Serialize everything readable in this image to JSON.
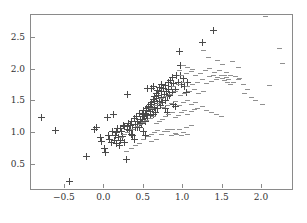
{
  "chart_data": {
    "type": "scatter",
    "title": "",
    "subtitle": "",
    "xlabel": "",
    "ylabel": "",
    "xlim": [
      -0.93,
      2.38
    ],
    "ylim": [
      0.12,
      2.86
    ],
    "xticks": [
      -0.5,
      0.0,
      0.5,
      1.0,
      1.5,
      2.0
    ],
    "xticklabels": [
      "−0.5",
      "0.0",
      "0.5",
      "1.0",
      "1.5",
      "2.0"
    ],
    "yticks": [
      0.5,
      1.0,
      1.5,
      2.0,
      2.5
    ],
    "yticklabels": [
      "0.5",
      "1.0",
      "1.5",
      "2.0",
      "2.5"
    ],
    "grid": false,
    "legend": false,
    "legend_position": "none",
    "frame": true,
    "colors": {
      "cross": "#4a4a4a",
      "dash": "#909090",
      "axis": "#8a8a8a",
      "text": "#333333",
      "background": "#ffffff"
    },
    "series": [
      {
        "name": "cross",
        "marker": "plus",
        "points": [
          [
            -0.8,
            1.245
          ],
          [
            -0.62,
            1.045
          ],
          [
            -0.44,
            0.235
          ],
          [
            -0.23,
            0.625
          ],
          [
            -0.12,
            1.055
          ],
          [
            -0.1,
            1.085
          ],
          [
            -0.05,
            0.935
          ],
          [
            -0.03,
            0.875
          ],
          [
            0.0,
            0.76
          ],
          [
            0.02,
            0.7
          ],
          [
            0.04,
            1.245
          ],
          [
            0.05,
            0.96
          ],
          [
            0.07,
            0.905
          ],
          [
            0.09,
            0.855
          ],
          [
            0.1,
            1.02
          ],
          [
            0.12,
            1.295
          ],
          [
            0.13,
            0.88
          ],
          [
            0.15,
            0.83
          ],
          [
            0.16,
            1.015
          ],
          [
            0.18,
            0.925
          ],
          [
            0.19,
            0.805
          ],
          [
            0.2,
            0.88
          ],
          [
            0.22,
            1.02
          ],
          [
            0.23,
            0.95
          ],
          [
            0.25,
            0.855
          ],
          [
            0.26,
            1.1
          ],
          [
            0.28,
            0.59
          ],
          [
            0.29,
            1.05
          ],
          [
            0.3,
            1.61
          ],
          [
            0.31,
            1.15
          ],
          [
            0.33,
            1.12
          ],
          [
            0.34,
            1.19
          ],
          [
            0.35,
            0.985
          ],
          [
            0.36,
            1.06
          ],
          [
            0.38,
            1.225
          ],
          [
            0.39,
            1.14
          ],
          [
            0.4,
            1.085
          ],
          [
            0.41,
            1.255
          ],
          [
            0.42,
            1.18
          ],
          [
            0.44,
            1.09
          ],
          [
            0.45,
            1.31
          ],
          [
            0.46,
            1.215
          ],
          [
            0.47,
            1.15
          ],
          [
            0.48,
            1.29
          ],
          [
            0.5,
            1.35
          ],
          [
            0.51,
            1.265
          ],
          [
            0.52,
            1.19
          ],
          [
            0.53,
            1.39
          ],
          [
            0.54,
            1.3
          ],
          [
            0.55,
            1.23
          ],
          [
            0.56,
            1.42
          ],
          [
            0.58,
            1.34
          ],
          [
            0.59,
            1.275
          ],
          [
            0.6,
            1.45
          ],
          [
            0.61,
            1.365
          ],
          [
            0.62,
            1.3
          ],
          [
            0.63,
            1.5
          ],
          [
            0.64,
            1.41
          ],
          [
            0.65,
            1.33
          ],
          [
            0.66,
            1.55
          ],
          [
            0.67,
            1.46
          ],
          [
            0.68,
            1.38
          ],
          [
            0.69,
            1.6
          ],
          [
            0.7,
            1.505
          ],
          [
            0.71,
            1.43
          ],
          [
            0.72,
            1.66
          ],
          [
            0.73,
            1.56
          ],
          [
            0.74,
            1.48
          ],
          [
            0.75,
            1.7
          ],
          [
            0.76,
            1.61
          ],
          [
            0.77,
            1.52
          ],
          [
            0.78,
            1.745
          ],
          [
            0.79,
            1.65
          ],
          [
            0.8,
            1.57
          ],
          [
            0.81,
            1.79
          ],
          [
            0.82,
            1.69
          ],
          [
            0.83,
            1.6
          ],
          [
            0.84,
            1.835
          ],
          [
            0.85,
            1.735
          ],
          [
            0.86,
            1.64
          ],
          [
            0.72,
            1.76
          ],
          [
            0.7,
            1.715
          ],
          [
            0.68,
            1.67
          ],
          [
            0.66,
            1.625
          ],
          [
            0.64,
            1.58
          ],
          [
            0.62,
            1.535
          ],
          [
            0.6,
            1.49
          ],
          [
            0.58,
            1.445
          ],
          [
            0.56,
            1.4
          ],
          [
            0.54,
            1.355
          ],
          [
            0.52,
            1.31
          ],
          [
            0.5,
            1.265
          ],
          [
            0.48,
            1.22
          ],
          [
            0.46,
            1.175
          ],
          [
            0.44,
            1.13
          ],
          [
            0.42,
            1.085
          ],
          [
            0.87,
            1.88
          ],
          [
            0.88,
            1.78
          ],
          [
            0.9,
            1.69
          ],
          [
            0.92,
            1.91
          ],
          [
            0.94,
            1.805
          ],
          [
            0.95,
            2.29
          ],
          [
            0.96,
            2.065
          ],
          [
            0.97,
            1.9
          ],
          [
            0.98,
            1.76
          ],
          [
            1.0,
            1.86
          ],
          [
            1.02,
            1.74
          ],
          [
            1.04,
            1.64
          ],
          [
            1.05,
            1.805
          ],
          [
            0.62,
            1.74
          ],
          [
            0.6,
            1.695
          ],
          [
            0.55,
            1.705
          ],
          [
            0.78,
            1.385
          ],
          [
            0.8,
            1.33
          ],
          [
            0.5,
            1.025
          ],
          [
            0.52,
            0.96
          ],
          [
            1.25,
            2.425
          ],
          [
            1.39,
            2.615
          ],
          [
            0.88,
            1.455
          ],
          [
            0.9,
            1.42
          ],
          [
            0.3,
            1.105
          ],
          [
            0.32,
            1.045
          ],
          [
            0.24,
            1.125
          ],
          [
            0.21,
            1.065
          ],
          [
            0.36,
            0.96
          ],
          [
            0.38,
            0.905
          ],
          [
            0.14,
            0.96
          ],
          [
            0.17,
            1.08
          ]
        ]
      },
      {
        "name": "dash",
        "marker": "hline",
        "points": [
          [
            0.28,
            0.715
          ],
          [
            0.34,
            0.76
          ],
          [
            0.4,
            0.8
          ],
          [
            0.45,
            0.835
          ],
          [
            0.5,
            0.905
          ],
          [
            0.56,
            0.94
          ],
          [
            0.6,
            0.975
          ],
          [
            0.64,
            1.01
          ],
          [
            0.68,
            1.045
          ],
          [
            0.72,
            0.985
          ],
          [
            0.76,
            1.02
          ],
          [
            0.8,
            1.055
          ],
          [
            0.85,
            0.965
          ],
          [
            0.9,
            1.0
          ],
          [
            0.95,
            1.055
          ],
          [
            1.0,
            1.01
          ],
          [
            1.05,
            0.98
          ],
          [
            0.42,
            1.1
          ],
          [
            0.46,
            1.135
          ],
          [
            0.5,
            1.165
          ],
          [
            0.54,
            1.2
          ],
          [
            0.58,
            1.23
          ],
          [
            0.62,
            1.265
          ],
          [
            0.66,
            1.15
          ],
          [
            0.7,
            1.185
          ],
          [
            0.74,
            1.22
          ],
          [
            0.78,
            1.255
          ],
          [
            0.82,
            1.29
          ],
          [
            0.86,
            1.325
          ],
          [
            0.9,
            1.25
          ],
          [
            0.94,
            1.285
          ],
          [
            0.98,
            1.32
          ],
          [
            1.02,
            1.355
          ],
          [
            1.06,
            1.3
          ],
          [
            1.1,
            1.335
          ],
          [
            1.14,
            1.37
          ],
          [
            0.6,
            1.395
          ],
          [
            0.65,
            1.43
          ],
          [
            0.7,
            1.465
          ],
          [
            0.75,
            1.4
          ],
          [
            0.8,
            1.435
          ],
          [
            0.85,
            1.47
          ],
          [
            0.9,
            1.505
          ],
          [
            0.95,
            1.44
          ],
          [
            1.0,
            1.475
          ],
          [
            1.05,
            1.51
          ],
          [
            1.1,
            1.445
          ],
          [
            1.15,
            1.48
          ],
          [
            0.72,
            1.545
          ],
          [
            0.78,
            1.58
          ],
          [
            0.84,
            1.615
          ],
          [
            0.9,
            1.65
          ],
          [
            0.96,
            1.585
          ],
          [
            1.02,
            1.62
          ],
          [
            1.08,
            1.655
          ],
          [
            1.14,
            1.69
          ],
          [
            1.2,
            1.625
          ],
          [
            1.26,
            1.66
          ],
          [
            0.88,
            1.73
          ],
          [
            0.94,
            1.765
          ],
          [
            1.0,
            1.8
          ],
          [
            1.06,
            1.735
          ],
          [
            1.12,
            1.77
          ],
          [
            1.18,
            1.805
          ],
          [
            1.24,
            1.84
          ],
          [
            1.3,
            1.775
          ],
          [
            1.36,
            1.81
          ],
          [
            1.42,
            1.845
          ],
          [
            0.98,
            1.905
          ],
          [
            1.04,
            1.94
          ],
          [
            1.1,
            1.975
          ],
          [
            1.16,
            1.91
          ],
          [
            1.22,
            1.945
          ],
          [
            1.28,
            1.98
          ],
          [
            1.34,
            2.015
          ],
          [
            1.4,
            1.95
          ],
          [
            1.46,
            1.985
          ],
          [
            1.52,
            1.9
          ],
          [
            1.55,
            1.87
          ],
          [
            1.58,
            1.84
          ],
          [
            1.5,
            1.855
          ],
          [
            1.53,
            1.825
          ],
          [
            1.56,
            1.8
          ],
          [
            1.6,
            1.77
          ],
          [
            1.64,
            1.8
          ],
          [
            1.7,
            1.84
          ],
          [
            1.76,
            1.76
          ],
          [
            1.82,
            1.69
          ],
          [
            1.26,
            2.3
          ],
          [
            1.32,
            2.19
          ],
          [
            1.44,
            2.145
          ],
          [
            1.5,
            2.085
          ],
          [
            1.62,
            2.12
          ],
          [
            1.7,
            2.04
          ],
          [
            1.78,
            1.63
          ],
          [
            1.86,
            1.56
          ],
          [
            1.92,
            1.51
          ],
          [
            2.0,
            1.45
          ],
          [
            2.05,
            2.835
          ],
          [
            2.22,
            2.335
          ],
          [
            2.26,
            2.1
          ],
          [
            2.1,
            1.75
          ],
          [
            1.18,
            1.395
          ],
          [
            1.24,
            1.42
          ],
          [
            1.3,
            1.355
          ],
          [
            1.36,
            1.32
          ],
          [
            1.42,
            1.29
          ],
          [
            1.48,
            1.26
          ],
          [
            0.8,
            1.02
          ],
          [
            0.86,
            1.055
          ],
          [
            0.92,
            0.985
          ],
          [
            0.98,
            0.96
          ],
          [
            1.04,
            1.09
          ],
          [
            1.1,
            1.125
          ],
          [
            0.66,
            0.905
          ],
          [
            0.6,
            0.87
          ],
          [
            0.36,
            1.06
          ],
          [
            0.3,
            1.015
          ],
          [
            0.26,
            0.975
          ],
          [
            0.22,
            0.935
          ],
          [
            1.0,
            2.06
          ],
          [
            1.06,
            2.035
          ],
          [
            0.95,
            1.99
          ],
          [
            1.12,
            2.005
          ],
          [
            1.55,
            1.95
          ],
          [
            1.6,
            1.915
          ],
          [
            1.66,
            1.885
          ],
          [
            1.72,
            1.86
          ],
          [
            1.48,
            1.91
          ],
          [
            1.44,
            1.88
          ],
          [
            1.38,
            1.915
          ],
          [
            1.34,
            1.885
          ]
        ]
      }
    ]
  }
}
